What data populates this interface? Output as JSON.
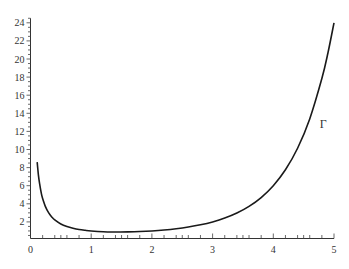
{
  "chart_data": {
    "type": "line",
    "title": "",
    "xlabel": "",
    "ylabel": "",
    "xlim": [
      0,
      5
    ],
    "ylim": [
      0,
      24.5
    ],
    "grid": false,
    "legend": "none",
    "x_ticks": [
      0,
      1,
      2,
      3,
      4,
      5
    ],
    "x_tick_labels": [
      "0",
      "1",
      "2",
      "3",
      "4",
      "5"
    ],
    "y_ticks": [
      2,
      4,
      6,
      8,
      10,
      12,
      14,
      16,
      18,
      20,
      22,
      24
    ],
    "y_tick_labels": [
      "2",
      "4",
      "6",
      "8",
      "10",
      "12",
      "14",
      "16",
      "18",
      "20",
      "22",
      "24"
    ],
    "annotations": [
      {
        "text": "Γ",
        "x": 4.75,
        "y": 12.8
      }
    ],
    "series": [
      {
        "name": "Γ",
        "color": "#1a1a1a",
        "x": [
          0.11,
          0.13,
          0.15,
          0.18,
          0.2,
          0.25,
          0.3,
          0.35,
          0.4,
          0.5,
          0.6,
          0.7,
          0.8,
          0.9,
          1.0,
          1.2,
          1.4,
          1.46,
          1.6,
          1.8,
          2.0,
          2.2,
          2.4,
          2.6,
          2.8,
          3.0,
          3.2,
          3.4,
          3.6,
          3.8,
          4.0,
          4.2,
          4.4,
          4.6,
          4.8,
          4.9,
          5.0
        ],
        "values": [
          8.6,
          7.2,
          6.22,
          5.09,
          4.59,
          3.63,
          2.99,
          2.55,
          2.22,
          1.77,
          1.49,
          1.3,
          1.16,
          1.07,
          1.0,
          0.918,
          0.887,
          0.886,
          0.894,
          0.931,
          1.0,
          1.102,
          1.242,
          1.43,
          1.676,
          2.0,
          2.424,
          2.981,
          3.717,
          4.694,
          6.0,
          7.757,
          10.136,
          13.381,
          17.837,
          20.667,
          24.0
        ]
      }
    ]
  },
  "labels": {
    "curve_label": "Γ"
  }
}
